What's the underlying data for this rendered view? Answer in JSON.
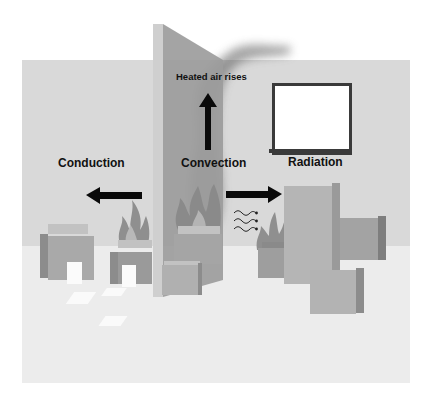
{
  "diagram": {
    "labels": {
      "heated_air": "Heated air rises",
      "conduction": "Conduction",
      "convection": "Convection",
      "radiation": "Radiation"
    },
    "arrows": [
      {
        "label_ref": "heated_air",
        "direction": "up"
      },
      {
        "label_ref": "conduction",
        "direction": "left"
      },
      {
        "label_ref": "convection",
        "direction": "right"
      }
    ],
    "icons": [
      "fire-icon",
      "heat-wave-icon",
      "smoke-plume",
      "window-frame"
    ],
    "colors": {
      "background": "#ffffff",
      "back_wall": "#d9d9d9",
      "floor": "#ececec",
      "partition": "#9c9c9c",
      "partition_edge": "#cfcfcf",
      "box_front": "#a9a9a9",
      "box_top": "#c2c2c2",
      "box_side": "#8c8c8c",
      "flame": "#8f8f8f",
      "text": "#111111"
    }
  }
}
